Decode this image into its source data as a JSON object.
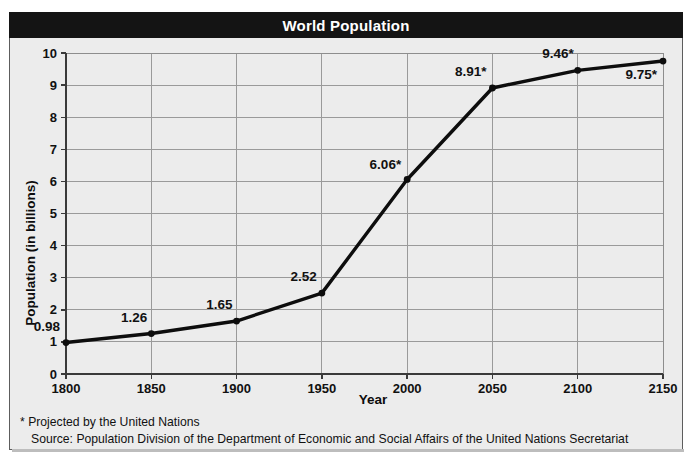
{
  "header": {
    "title": "World Population"
  },
  "chart_data": {
    "type": "line",
    "title": "World Population",
    "xlabel": "Year",
    "ylabel": "Population (in billions)",
    "x": [
      1800,
      1850,
      1900,
      1950,
      2000,
      2050,
      2100,
      2150
    ],
    "categories": [
      "1800",
      "1850",
      "1900",
      "1950",
      "2000",
      "2050",
      "2100",
      "2150"
    ],
    "values": [
      0.98,
      1.26,
      1.65,
      2.52,
      6.06,
      8.91,
      9.46,
      9.75
    ],
    "point_labels": [
      "0.98",
      "1.26",
      "1.65",
      "2.52",
      "6.06*",
      "8.91*",
      "9.46*",
      "9.75*"
    ],
    "projected": [
      false,
      false,
      false,
      false,
      true,
      true,
      true,
      true
    ],
    "xlim": [
      1800,
      2150
    ],
    "ylim": [
      0,
      10
    ],
    "ytick_labels": [
      "0",
      "1",
      "2",
      "3",
      "4",
      "5",
      "6",
      "7",
      "8",
      "9",
      "10"
    ],
    "yticks": [
      0,
      1,
      2,
      3,
      4,
      5,
      6,
      7,
      8,
      9,
      10
    ],
    "xtick_step": 50,
    "grid": true,
    "legend": "none",
    "series_color": "#0d0d0d",
    "marker": "circle"
  },
  "notes": {
    "footnote": "* Projected by the United Nations",
    "source": "Source: Population Division of the Department of Economic and Social Affairs of the United Nations Secretariat"
  },
  "colors": {
    "title_bar": "#141414",
    "title_text": "#ffffff",
    "plot_background": "#ececec",
    "gridline": "#9a9a9a",
    "axis": "#3a3a3a"
  }
}
